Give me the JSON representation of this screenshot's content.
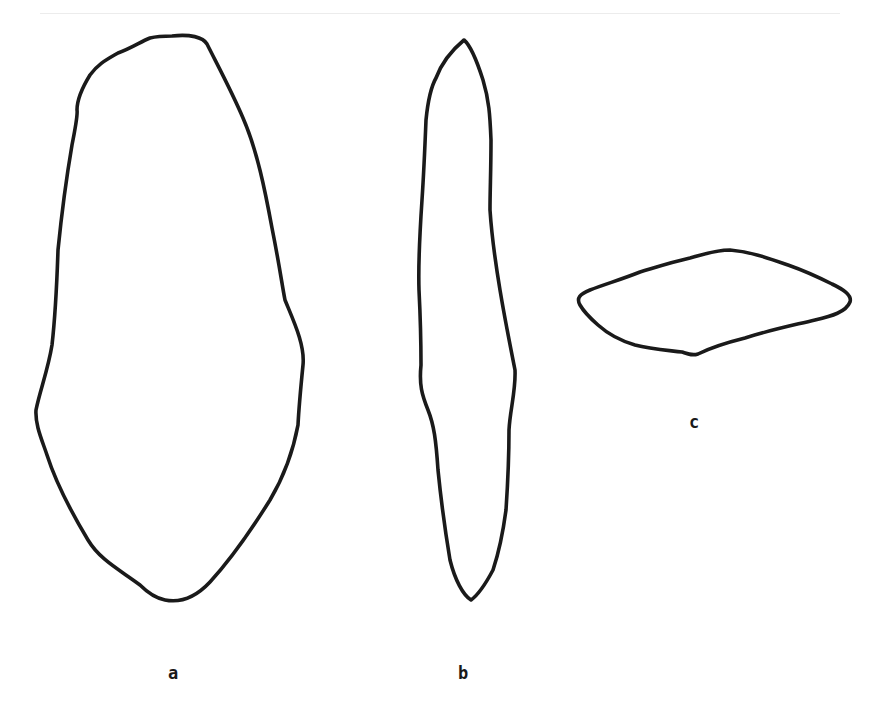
{
  "figure": {
    "background": "#ffffff",
    "stroke_color": "#1a1a1a",
    "views": [
      {
        "id": "a",
        "label": "a",
        "label_pos": [
          173,
          673
        ],
        "path": "M 172 36 C 190 34 203 37 207 44 C 218 66 232 92 243 118 C 257 150 265 190 272 228 C 280 268 282 285 285 300 C 294 322 305 345 303 365 C 300 395 299 405 298 425 C 293 452 283 478 270 500 C 250 532 230 560 210 582 C 195 598 180 603 165 600 C 155 598 145 590 140 585 C 120 570 100 560 88 540 C 70 510 55 480 47 455 C 42 440 35 425 36 410 C 40 390 48 370 52 345 C 56 310 57 280 58 250 C 62 210 66 180 72 145 C 76 125 78 115 77 110 C 77 100 82 88 90 75 C 98 64 106 60 118 53 C 132 48 140 42 150 38 C 158 36 165 36 172 36 Z"
      },
      {
        "id": "b",
        "label": "b",
        "label_pos": [
          463,
          673
        ],
        "path": "M 464 40 C 470 45 476 58 483 80 C 489 100 490 115 491 140 C 491 170 490 190 490 210 C 492 240 495 260 500 290 C 505 320 510 345 515 370 C 516 390 510 410 509 430 C 509 460 508 480 506 510 C 502 540 498 555 493 570 C 485 585 478 595 471 600 C 463 595 455 580 450 560 C 445 530 441 500 438 470 C 436 440 434 425 428 410 C 422 395 419 385 421 365 C 421 340 420 310 419 290 C 418 260 420 230 422 200 C 424 170 425 145 426 120 C 428 100 432 85 436 78 C 442 62 452 50 464 40 Z"
      },
      {
        "id": "c",
        "label": "c",
        "label_pos": [
          694,
          422
        ],
        "label_dot": true,
        "path": "M 730 250 C 752 252 768 258 788 265 C 808 272 820 278 832 284 C 845 290 852 296 850 302 C 846 312 832 316 815 320 C 790 326 770 330 745 338 C 725 343 710 348 698 354 C 692 356 688 354 682 352 C 665 350 650 349 635 345 C 618 340 608 334 598 325 C 590 318 584 312 580 305 C 576 298 580 294 590 290 C 605 284 620 280 640 272 C 660 266 672 262 690 258 C 705 254 716 250 730 250 Z"
      }
    ]
  }
}
